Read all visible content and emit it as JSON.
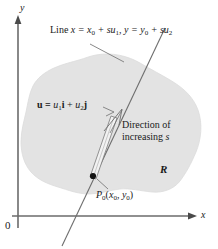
{
  "figure": {
    "type": "diagram",
    "background_color": "#ffffff",
    "ink_color": "#4a4a4a",
    "text_color": "#1a1a1a",
    "region_fill_color": "#e3e3e3",
    "region_edge_color": "#d8d8d8"
  },
  "axes": {
    "x_label": "x",
    "y_label": "y",
    "origin_label": "0",
    "x_axis": {
      "from": [
        18,
        216
      ],
      "to": [
        196,
        216
      ],
      "arrow": true
    },
    "y_axis": {
      "from": [
        18,
        228
      ],
      "to": [
        18,
        16
      ],
      "arrow": true
    }
  },
  "labels": {
    "line_equation": {
      "prefix": "Line ",
      "x_part": "x = x",
      "x_sub": "0",
      "x_tail": " + su",
      "x_tail_sub": "1",
      "sep": ", ",
      "y_part": "y = y",
      "y_sub": "0",
      "y_tail": " + su",
      "y_tail_sub": "2",
      "plain": "Line x = x0 + su1, y = y0 + su2"
    },
    "vector_equation": {
      "u": "u",
      "eq": " = ",
      "u1": "u",
      "u1_sub": "1",
      "i": "i",
      "plus": " + ",
      "u2": "u",
      "u2_sub": "2",
      "j": "j",
      "plain": "u = u1i + u2j"
    },
    "direction": {
      "line1": "Direction of",
      "line2_prefix": "increasing ",
      "line2_var": "s",
      "plain": "Direction of increasing s"
    },
    "region": "R",
    "point": {
      "p": "P",
      "p_sub": "0",
      "open": "(",
      "x": "x",
      "x_sub": "0",
      "comma": ", ",
      "y": "y",
      "y_sub": "0",
      "close": ")",
      "plain": "P0(x0, y0)"
    }
  },
  "geometry": {
    "point_P0": [
      93,
      176
    ],
    "line_endpoints": [
      [
        62,
        246
      ],
      [
        165,
        28
      ]
    ],
    "vector_arrow_tip": [
      122,
      110
    ],
    "leader_line": [
      [
        92,
        45
      ],
      [
        124,
        62
      ]
    ]
  }
}
